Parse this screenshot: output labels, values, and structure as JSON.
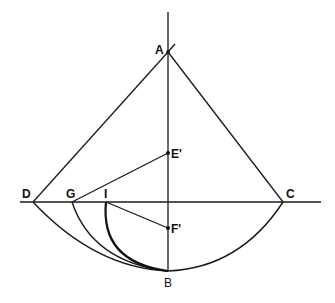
{
  "figure": {
    "labels": {
      "A": "A",
      "B": "B",
      "C": "C",
      "D": "D",
      "E": "E'",
      "F": "F'",
      "G": "G",
      "I": "I"
    },
    "points": {
      "A": [
        168,
        52
      ],
      "B": [
        168,
        271
      ],
      "C": [
        283,
        202
      ],
      "D": [
        33,
        202
      ],
      "E": [
        168,
        153
      ],
      "F": [
        168,
        228
      ],
      "G": [
        72,
        202
      ],
      "I": [
        106,
        202
      ]
    },
    "colors": {
      "stroke": "#1a1a1a",
      "background": "#ffffff"
    }
  }
}
